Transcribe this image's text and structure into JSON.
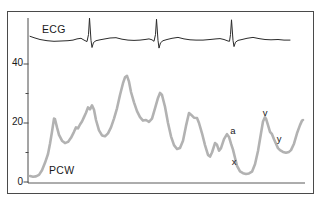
{
  "figure": {
    "ecg_trace_label": "ECG",
    "pcw_trace_label": "PCW"
  },
  "axis": {
    "tick_labels": {
      "t0": "0",
      "t20": "20",
      "t40": "40"
    }
  },
  "chart_data": {
    "type": "line",
    "title": "",
    "xlabel": "",
    "ylabel": "",
    "ylim": [
      0,
      58
    ],
    "yticks_labeled": [
      0,
      20,
      40
    ],
    "yticks_minor": [
      10,
      30
    ],
    "grid": false,
    "legend_position": "none",
    "series": [
      {
        "name": "ECG",
        "color": "#2b2b2b",
        "stroke_width": 1,
        "points": [
          [
            30,
            49.4
          ],
          [
            34,
            48.9
          ],
          [
            40,
            48.3
          ],
          [
            47,
            47.9
          ],
          [
            54,
            47.7
          ],
          [
            61,
            47.8
          ],
          [
            68,
            47.9
          ],
          [
            73,
            48.1
          ],
          [
            77,
            48.5
          ],
          [
            81,
            48.7
          ],
          [
            84,
            48.1
          ],
          [
            87,
            47.6
          ],
          [
            88.5,
            50
          ],
          [
            89.5,
            55.6
          ],
          [
            91,
            48
          ],
          [
            92,
            45.6
          ],
          [
            93.5,
            47.3
          ],
          [
            96,
            47.9
          ],
          [
            100,
            48.2
          ],
          [
            105,
            48.5
          ],
          [
            110,
            48.8
          ],
          [
            116,
            48.9
          ],
          [
            122,
            48.4
          ],
          [
            128,
            48.1
          ],
          [
            134,
            48.0
          ],
          [
            140,
            48.1
          ],
          [
            145,
            48.3
          ],
          [
            149,
            48.5
          ],
          [
            152,
            48.2
          ],
          [
            154,
            47.7
          ],
          [
            155.5,
            50
          ],
          [
            156.5,
            55.2
          ],
          [
            158,
            48
          ],
          [
            159,
            45.4
          ],
          [
            160.5,
            47.2
          ],
          [
            163,
            47.9
          ],
          [
            167,
            48.3
          ],
          [
            172,
            48.7
          ],
          [
            178,
            49.0
          ],
          [
            184,
            48.5
          ],
          [
            190,
            48.2
          ],
          [
            196,
            48.1
          ],
          [
            203,
            48.1
          ],
          [
            210,
            48.3
          ],
          [
            216,
            48.5
          ],
          [
            220,
            48.6
          ],
          [
            224,
            48.3
          ],
          [
            228,
            47.8
          ],
          [
            229.5,
            47.7
          ],
          [
            230.5,
            50
          ],
          [
            231.5,
            55.0
          ],
          [
            233,
            48
          ],
          [
            234,
            45.9
          ],
          [
            235.5,
            47.4
          ],
          [
            238,
            48.0
          ],
          [
            242,
            48.3
          ],
          [
            247,
            48.7
          ],
          [
            253,
            49.0
          ],
          [
            259,
            48.6
          ],
          [
            265,
            48.3
          ],
          [
            271,
            48.2
          ],
          [
            278,
            48.3
          ],
          [
            284,
            48.1
          ],
          [
            290,
            48.1
          ]
        ]
      },
      {
        "name": "PCW",
        "color": "#b2b2b2",
        "stroke_width": 2.6,
        "points": [
          [
            30,
            2.0
          ],
          [
            33,
            1.8
          ],
          [
            36,
            1.9
          ],
          [
            39,
            2.4
          ],
          [
            42,
            4.0
          ],
          [
            45,
            6.5
          ],
          [
            48,
            9.5
          ],
          [
            50,
            13
          ],
          [
            52,
            17
          ],
          [
            54,
            21.5
          ],
          [
            55,
            21.3
          ],
          [
            57,
            18.5
          ],
          [
            59,
            16
          ],
          [
            62,
            14
          ],
          [
            65,
            13.2
          ],
          [
            68,
            13.6
          ],
          [
            71,
            15
          ],
          [
            74,
            17
          ],
          [
            76,
            18.5
          ],
          [
            78,
            18.2
          ],
          [
            80,
            19.5
          ],
          [
            82,
            20.5
          ],
          [
            84,
            22
          ],
          [
            86,
            23.5
          ],
          [
            88,
            25.3
          ],
          [
            90,
            24.6
          ],
          [
            92,
            26
          ],
          [
            94,
            24.5
          ],
          [
            96,
            21
          ],
          [
            99,
            17.5
          ],
          [
            102,
            15.8
          ],
          [
            105,
            15.5
          ],
          [
            108,
            16.5
          ],
          [
            111,
            18.5
          ],
          [
            114,
            21.5
          ],
          [
            117,
            25
          ],
          [
            120,
            29.5
          ],
          [
            123,
            33.5
          ],
          [
            125,
            35.5
          ],
          [
            127,
            36
          ],
          [
            129,
            34
          ],
          [
            131,
            30.5
          ],
          [
            134,
            27
          ],
          [
            137,
            24
          ],
          [
            140,
            22
          ],
          [
            143,
            20.8
          ],
          [
            146,
            21
          ],
          [
            149,
            20.4
          ],
          [
            152,
            21.5
          ],
          [
            155,
            25
          ],
          [
            158,
            28.5
          ],
          [
            160,
            30.2
          ],
          [
            162,
            29.5
          ],
          [
            165,
            25.5
          ],
          [
            168,
            20
          ],
          [
            171,
            15.5
          ],
          [
            174,
            12.5
          ],
          [
            177,
            11.2
          ],
          [
            180,
            11.5
          ],
          [
            183,
            14
          ],
          [
            186,
            19
          ],
          [
            189,
            23.4
          ],
          [
            191,
            22.8
          ],
          [
            194,
            21.8
          ],
          [
            197,
            21.7
          ],
          [
            199,
            20
          ],
          [
            202,
            16.5
          ],
          [
            205,
            12.5
          ],
          [
            208,
            9.2
          ],
          [
            210,
            8.6
          ],
          [
            212,
            10
          ],
          [
            215,
            13.2
          ],
          [
            217,
            12.6
          ],
          [
            219,
            10.6
          ],
          [
            221,
            11.5
          ],
          [
            224,
            14.5
          ],
          [
            227,
            16.2
          ],
          [
            229,
            15.3
          ],
          [
            231,
            13
          ],
          [
            233,
            11
          ],
          [
            235,
            8.2
          ],
          [
            237,
            5.5
          ],
          [
            240,
            3.6
          ],
          [
            243,
            3.0
          ],
          [
            246,
            2.7
          ],
          [
            249,
            2.9
          ],
          [
            252,
            3.5
          ],
          [
            255,
            6
          ],
          [
            258,
            10.5
          ],
          [
            261,
            16.5
          ],
          [
            263,
            20.5
          ],
          [
            265,
            22
          ],
          [
            266,
            21.5
          ],
          [
            268,
            19.3
          ],
          [
            270,
            17
          ],
          [
            272,
            16.2
          ],
          [
            274,
            14.5
          ],
          [
            276,
            13
          ],
          [
            278,
            11.5
          ],
          [
            280,
            10.8
          ],
          [
            283,
            10.2
          ],
          [
            286,
            9.9
          ],
          [
            289,
            10.2
          ],
          [
            291,
            10.8
          ],
          [
            294,
            13
          ],
          [
            297,
            16.5
          ],
          [
            300,
            19.3
          ],
          [
            302,
            20.8
          ],
          [
            303,
            21
          ]
        ]
      }
    ],
    "annotations": [
      {
        "label": "a",
        "x": 233,
        "v": 17.6
      },
      {
        "label": "x",
        "x": 234,
        "v": 6.9
      },
      {
        "label": "v",
        "x": 265,
        "v": 23.5
      },
      {
        "label": "y",
        "x": 279,
        "v": 14.9
      }
    ]
  }
}
